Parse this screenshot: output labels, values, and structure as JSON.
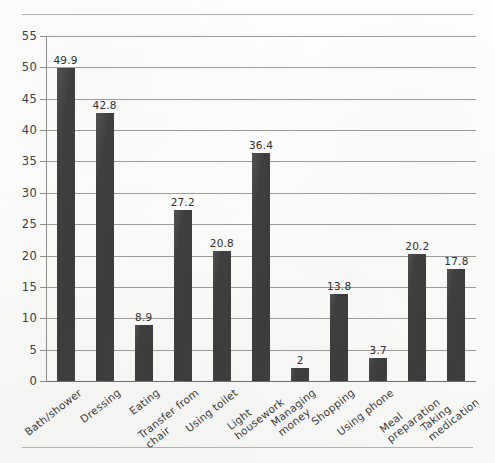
{
  "chart_data": {
    "type": "bar",
    "title": "",
    "subtitle": "",
    "xlabel": "",
    "ylabel": "",
    "ylim": [
      0,
      55
    ],
    "ytick_step": 5,
    "grid": true,
    "legend": "none",
    "orientation": "vertical",
    "bar_color": "#3f3f3f",
    "categories": [
      "Bath/shower",
      "Dressing",
      "Eating",
      "Transfer from\nchair",
      "Using toilet",
      "Light\nhousework",
      "Managing\nmoney",
      "Shopping",
      "Using phone",
      "Meal\npreparation",
      "Taking\nmedication"
    ],
    "values": [
      49.9,
      42.8,
      8.9,
      27.2,
      20.8,
      36.4,
      2,
      13.8,
      3.7,
      20.2,
      17.8
    ],
    "value_labels": [
      "49.9",
      "42.8",
      "8.9",
      "27.2",
      "20.8",
      "36.4",
      "2",
      "13.8",
      "3.7",
      "20.2",
      "17.8"
    ],
    "ytick_labels": [
      "55",
      "50",
      "45",
      "40",
      "35",
      "30",
      "25",
      "20",
      "15",
      "10",
      "5",
      "0"
    ],
    "ytick_values": [
      55,
      50,
      45,
      40,
      35,
      30,
      25,
      20,
      15,
      10,
      5,
      0
    ]
  },
  "frame": {
    "top_rule": "page-top-rule",
    "bottom_rule": "page-bottom-rule"
  }
}
